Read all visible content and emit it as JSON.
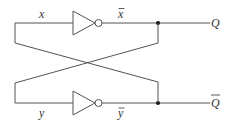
{
  "diagram": {
    "type": "logic-circuit",
    "colors": {
      "wire": "#555555",
      "junction": "#111111",
      "label": "#333333",
      "background": "#ffffff"
    },
    "gates": [
      {
        "id": "not-top",
        "type": "NOT",
        "input": "x",
        "output": "x̄"
      },
      {
        "id": "not-bottom",
        "type": "NOT",
        "input": "y",
        "output": "ȳ"
      }
    ],
    "labels": {
      "top_input": "x",
      "top_output": "x",
      "bottom_input": "y",
      "bottom_output": "y",
      "output_q": "Q",
      "output_q_bar": "Q"
    },
    "label_overbars": {
      "top_output": true,
      "bottom_output": true,
      "output_q_bar": true
    },
    "outputs": [
      "Q",
      "Q̄"
    ],
    "connections": [
      {
        "from": "x̄ junction",
        "to": "y (cross-coupled feedback)"
      },
      {
        "from": "ȳ junction",
        "to": "x (cross-coupled feedback)"
      }
    ]
  }
}
